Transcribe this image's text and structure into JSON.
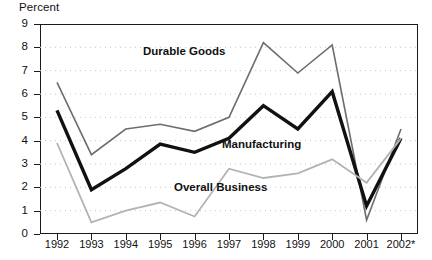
{
  "chart_data": {
    "type": "line",
    "title": "",
    "ylabel": "Percent",
    "xlabel": "",
    "ylim": [
      0,
      9
    ],
    "yticks": [
      0,
      1,
      2,
      3,
      4,
      5,
      6,
      7,
      8,
      9
    ],
    "grid": true,
    "grid_style": "dotted-horizontal",
    "legend_position": "inline-annotations",
    "categories": [
      "1992",
      "1993",
      "1994",
      "1995",
      "1996",
      "1997",
      "1998",
      "1999",
      "2000",
      "2001",
      "2002*"
    ],
    "series": [
      {
        "name": "Durable Goods",
        "color": "#6e6e6e",
        "line_width": 1.6,
        "values": [
          6.5,
          3.4,
          4.5,
          4.7,
          4.4,
          5.0,
          8.2,
          6.9,
          8.1,
          0.6,
          4.5
        ]
      },
      {
        "name": "Manufacturing",
        "color": "#111111",
        "line_width": 3.4,
        "values": [
          5.3,
          1.9,
          2.8,
          3.85,
          3.5,
          4.1,
          5.5,
          4.5,
          6.1,
          1.2,
          4.1
        ]
      },
      {
        "name": "Overall Business",
        "color": "#b3b3b3",
        "line_width": 1.8,
        "values": [
          3.9,
          0.5,
          1.0,
          1.35,
          0.75,
          2.8,
          2.4,
          2.6,
          3.2,
          2.2,
          4.1
        ]
      }
    ],
    "annotations": [
      {
        "text": "Durable Goods",
        "series": "Durable Goods"
      },
      {
        "text": "Manufacturing",
        "series": "Manufacturing"
      },
      {
        "text": "Overall Business",
        "series": "Overall Business"
      }
    ]
  },
  "axis": {
    "y_title": "Percent",
    "y_tick_labels": [
      "9",
      "8",
      "7",
      "6",
      "5",
      "4",
      "3",
      "2",
      "1",
      "0"
    ],
    "x_tick_labels": [
      "1992",
      "1993",
      "1994",
      "1995",
      "1996",
      "1997",
      "1998",
      "1999",
      "2000",
      "2001",
      "2002*"
    ]
  }
}
